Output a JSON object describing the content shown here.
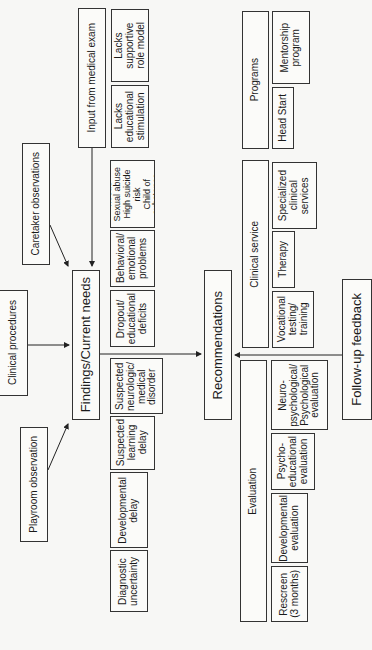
{
  "diagram": {
    "orientation": "rotated 90 degrees counter-clockwise",
    "inputs": {
      "medical_exam": "Input from medical exam",
      "caretaker": "Caretaker observations",
      "clinical_procedures": "Clinical procedures",
      "playroom": "Playroom observation"
    },
    "findings": {
      "title": "Findings/Current needs",
      "items": [
        "Lacks\nsupportive\nrole model",
        "Lacks\neducational\nstimulation",
        "Special\nneeds\nSexual abuse\nHigh suicide\nrisk\nChild of\nsubstance\nabusers",
        "Behavioral/\nemotional\nproblems",
        "Dropout/\neducational\ndeficits",
        "Suspected\nneurologic/\nmedical\ndisorder",
        "Suspected\nlearning\ndelay",
        "Developmental\ndelay",
        "Diagnostic\nuncertainty"
      ]
    },
    "recommendations": {
      "title": "Recommendations",
      "groups": [
        {
          "title": "Programs",
          "items": [
            "Mentorship\nprogram",
            "Head Start"
          ]
        },
        {
          "title": "Clinical service",
          "items": [
            "Specialized\nclinical\nservices",
            "Therapy",
            "Vocational\ntesting/\ntraining"
          ]
        },
        {
          "title": "Evaluation",
          "items": [
            "Neuro-\npsychological/\nPsychological\nevaluation",
            "Psycho-\neducational\nevaluation",
            "Developmental\nevaluation",
            "Rescreen\n(3 months)"
          ]
        }
      ]
    },
    "feedback": "Follow-up feedback"
  }
}
